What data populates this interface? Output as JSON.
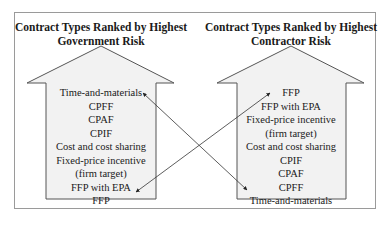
{
  "left_panel": {
    "title_line1": "Contract Types Ranked by Highest",
    "title_line2": "Government Risk",
    "items": [
      "Time-and-materials",
      "CPFF",
      "CPAF",
      "CPIF",
      "Cost and cost sharing",
      "Fixed-price incentive",
      "(firm target)",
      "FFP with EPA",
      "FFP"
    ]
  },
  "right_panel": {
    "title_line1": "Contract Types Ranked by Highest",
    "title_line2": "Contractor Risk",
    "items": [
      "FFP",
      "FFP with EPA",
      "Fixed-price incentive",
      "(firm target)",
      "Cost and cost sharing",
      "CPIF",
      "CPAF",
      "CPFF",
      "Time-and-materials"
    ]
  },
  "connectors": [
    {
      "from": "Time-and-materials (government risk)",
      "to": "Time-and-materials (contractor risk)"
    },
    {
      "from": "FFP (government risk)",
      "to": "FFP (contractor risk)"
    }
  ],
  "colors": {
    "arrow_fill": "#f2f2f2",
    "arrow_stroke": "#555555",
    "frame": "#9a9a9a",
    "connector": "#333333"
  }
}
